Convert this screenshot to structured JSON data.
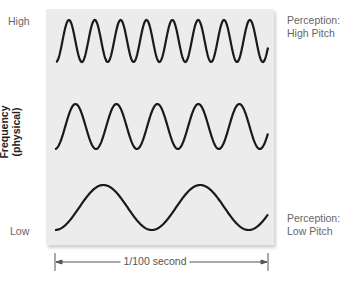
{
  "diagram": {
    "y_axis": {
      "title_line1": "Frequency",
      "title_line2": "(physical)",
      "high_label": "High",
      "low_label": "Low"
    },
    "perception": {
      "high": {
        "line1": "Perception:",
        "line2": "High Pitch"
      },
      "low": {
        "line1": "Perception:",
        "line2": "Low Pitch"
      }
    },
    "time_span": {
      "label": "1/100 second"
    },
    "waves": [
      {
        "name": "high-frequency",
        "cycles": 8
      },
      {
        "name": "medium-frequency",
        "cycles": 5
      },
      {
        "name": "low-frequency",
        "cycles": 2
      }
    ],
    "colors": {
      "panel": "#ececec",
      "wave": "#1a1a1a",
      "text": "#666666"
    }
  }
}
